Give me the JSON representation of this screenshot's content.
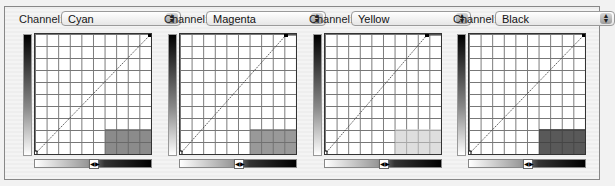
{
  "channel_label": "Channel:",
  "panels": [
    {
      "channel": "Cyan",
      "shade_color": "#8a8a8a",
      "end_x": 116
    },
    {
      "channel": "Magenta",
      "shade_color": "#8f8f8f",
      "end_x": 108
    },
    {
      "channel": "Yellow",
      "shade_color": "#dedede",
      "end_x": 106
    },
    {
      "channel": "Black",
      "shade_color": "#555555",
      "end_x": 116
    }
  ],
  "icons": {
    "popup": "up-down-arrows-icon",
    "slider": "left-right-arrows-icon"
  }
}
